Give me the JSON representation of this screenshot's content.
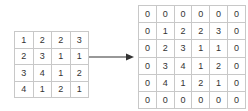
{
  "diagram": {
    "type": "zero-padding",
    "input_matrix": {
      "rows": 4,
      "cols": 4,
      "values": [
        [
          "1",
          "2",
          "2",
          "3"
        ],
        [
          "2",
          "3",
          "1",
          "1"
        ],
        [
          "3",
          "4",
          "1",
          "2"
        ],
        [
          "4",
          "1",
          "2",
          "1"
        ]
      ]
    },
    "arrow": {
      "direction": "right",
      "color": "#333333"
    },
    "output_matrix": {
      "rows": 6,
      "cols": 6,
      "values": [
        [
          "0",
          "0",
          "0",
          "0",
          "0",
          "0"
        ],
        [
          "0",
          "1",
          "2",
          "2",
          "3",
          "0"
        ],
        [
          "0",
          "2",
          "3",
          "1",
          "1",
          "0"
        ],
        [
          "0",
          "3",
          "4",
          "1",
          "2",
          "0"
        ],
        [
          "0",
          "4",
          "1",
          "2",
          "1",
          "0"
        ],
        [
          "0",
          "0",
          "0",
          "0",
          "0",
          "0"
        ]
      ]
    },
    "colors": {
      "grid_line": "#c8c8c8",
      "text": "#333333",
      "background": "#ffffff"
    }
  }
}
